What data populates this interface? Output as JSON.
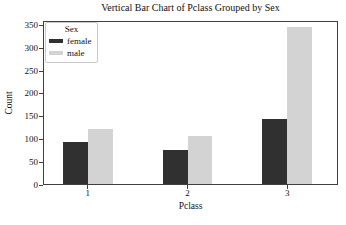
{
  "chart_data": {
    "type": "bar",
    "title": "Vertical Bar Chart of Pclass Grouped by Sex",
    "xlabel": "Pclass",
    "ylabel": "Count",
    "categories": [
      "1",
      "2",
      "3"
    ],
    "x_positions": [
      1,
      2,
      3
    ],
    "series": [
      {
        "name": "female",
        "color": "#303030",
        "values": [
          94,
          76,
          144
        ]
      },
      {
        "name": "male",
        "color": "#d3d3d3",
        "values": [
          122,
          108,
          347
        ]
      }
    ],
    "legend": {
      "title": "Sex",
      "position": "upper left"
    },
    "yticks": [
      0,
      50,
      100,
      150,
      200,
      250,
      300,
      350
    ],
    "ylim": [
      0,
      360
    ],
    "xlim": [
      0.55,
      3.51
    ],
    "bar_width": 0.25,
    "grid": false
  }
}
